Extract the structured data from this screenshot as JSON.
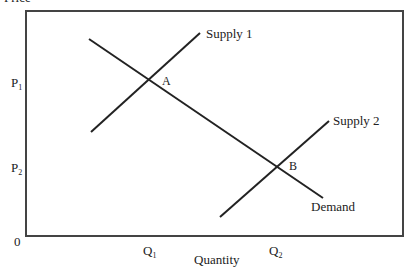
{
  "diagram": {
    "y_axis_label": "Price",
    "x_axis_label": "Quantity",
    "origin_label": "0",
    "price_ticks": [
      {
        "main": "P",
        "sub": "1",
        "y": 80
      },
      {
        "main": "P",
        "sub": "2",
        "y": 167
      }
    ],
    "quantity_ticks": [
      {
        "main": "Q",
        "sub": "1",
        "x": 149
      },
      {
        "main": "Q",
        "sub": "2",
        "x": 277
      }
    ],
    "curves": [
      {
        "name": "Demand",
        "label": "Demand"
      },
      {
        "name": "Supply 1",
        "label": "Supply 1"
      },
      {
        "name": "Supply 2",
        "label": "Supply 2"
      }
    ],
    "points": [
      {
        "label": "A"
      },
      {
        "label": "B"
      }
    ],
    "colors": {
      "line": "#222222",
      "frame": "#444444",
      "background": "#ffffff"
    }
  }
}
